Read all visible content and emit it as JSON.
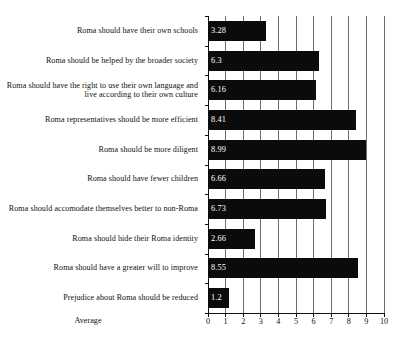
{
  "chart_data": {
    "type": "bar",
    "orientation": "horizontal",
    "title": "",
    "xlabel": "Average",
    "ylabel": "",
    "xlim": [
      0,
      10
    ],
    "grid": "vertical",
    "legend": "none",
    "categories": [
      "Roma should have their own schools",
      "Roma should be helped by the broader society",
      "Roma should have the right to use their own language and live according to their own culture",
      "Roma representatives should be more efficient",
      "Roma should be more diligent",
      "Roma should have fewer children",
      "Roma should accomodate themselves better to non-Roma",
      "Roma should hide their Roma identity",
      "Roma should have a greater will to improve",
      "Prejudice about Roma should be reduced"
    ],
    "values": [
      3.28,
      6.3,
      6.16,
      8.41,
      8.99,
      6.66,
      6.73,
      2.66,
      8.55,
      1.2
    ],
    "value_labels": [
      "3.28",
      "6.3",
      "6.16",
      "8.41",
      "8.99",
      "6.66",
      "6.73",
      "2.66",
      "8.55",
      "1.2"
    ],
    "xticks": [
      0,
      1,
      2,
      3,
      4,
      5,
      6,
      7,
      8,
      9,
      10
    ],
    "xtick_labels": [
      "0",
      "1",
      "2",
      "3",
      "4",
      "5",
      "6",
      "7",
      "8",
      "9",
      "10"
    ],
    "colors": {
      "bar": "#0b0b0b",
      "value_label": "#ffffff",
      "gridline": "#6d6d6d",
      "axis": "#101010",
      "background": "#ffffff",
      "text": "#111111"
    }
  }
}
